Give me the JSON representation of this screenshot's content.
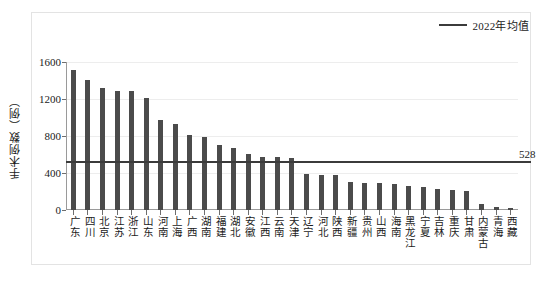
{
  "legend": {
    "entries": [
      {
        "label": "2022年均值",
        "color": "#3b3b3b",
        "marker": "line"
      }
    ],
    "position": "top-right"
  },
  "axes": {
    "y_title": "手术例数（例）",
    "y_ticks": [
      "1600",
      "1200",
      "800",
      "400",
      "0"
    ],
    "x_title": ""
  },
  "annotations": {
    "avg_value_label": "528"
  },
  "chart_data": {
    "type": "bar",
    "title": "",
    "xlabel": "",
    "ylabel": "手术例数（例）",
    "ylim": [
      0,
      1600
    ],
    "ytick_values": [
      0,
      400,
      800,
      1200,
      1600
    ],
    "grid": true,
    "legend_position": "top-right",
    "bar_color": "#4b4b4b",
    "categories": [
      "广东",
      "四川",
      "北京",
      "江苏",
      "浙江",
      "山东",
      "河南",
      "上海",
      "广西",
      "湖南",
      "福建",
      "湖北",
      "安徽",
      "江西",
      "云南",
      "天津",
      "辽宁",
      "河北",
      "陕西",
      "新疆",
      "贵州",
      "山西",
      "海南",
      "黑龙江",
      "宁夏",
      "吉林",
      "重庆",
      "甘肃",
      "内蒙古",
      "青海",
      "西藏"
    ],
    "values": [
      1514,
      1410,
      1318,
      1285,
      1285,
      1212,
      968,
      930,
      810,
      790,
      700,
      670,
      605,
      578,
      570,
      561,
      390,
      382,
      375,
      300,
      295,
      292,
      285,
      258,
      250,
      230,
      215,
      205,
      62,
      35,
      22
    ],
    "series": [
      {
        "name": "手术例数",
        "type": "bar",
        "values": [
          1514,
          1410,
          1318,
          1285,
          1285,
          1212,
          968,
          930,
          810,
          790,
          700,
          670,
          605,
          578,
          570,
          561,
          390,
          382,
          375,
          300,
          295,
          292,
          285,
          258,
          250,
          230,
          215,
          205,
          62,
          35,
          22
        ]
      },
      {
        "name": "2022年均值",
        "type": "hline",
        "value": 528,
        "color": "#3b3b3b"
      }
    ]
  }
}
